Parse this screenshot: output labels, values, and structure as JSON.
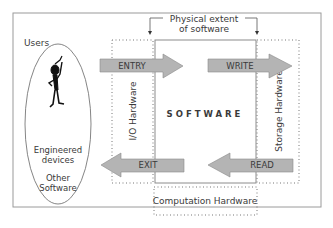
{
  "diagram": {
    "header_label_line1": "Physical extent",
    "header_label_line2": "of software",
    "users_label": "Users",
    "ellipse_text": [
      "Engineered",
      "devices",
      "Other",
      "Software"
    ],
    "center_label": "SOFTWARE",
    "io_hardware_label": "I/O Hardware",
    "storage_hardware_label": "Storage Hardware",
    "computation_hardware_label": "Computation Hardware",
    "arrows": {
      "entry": "ENTRY",
      "write": "WRITE",
      "exit": "EXIT",
      "read": "READ"
    },
    "colors": {
      "arrow_fill": "#b4b4b4",
      "arrow_stroke": "#8a8a8a",
      "frame": "#8c8c8c",
      "dotted": "#777777"
    }
  }
}
